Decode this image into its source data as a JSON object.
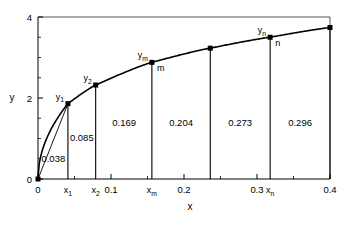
{
  "chart_data": {
    "type": "line",
    "title": "",
    "xlabel": "x",
    "ylabel": "y",
    "xlim": [
      0,
      0.4
    ],
    "ylim": [
      0,
      4
    ],
    "grid": false,
    "legend": "none",
    "x_ticks": [
      "0",
      "0.1",
      "0.2",
      "0.3",
      "0.4"
    ],
    "x_tick_values": [
      0,
      0.1,
      0.2,
      0.3,
      0.4
    ],
    "x_minor_step": 0.05,
    "y_ticks": [
      "0",
      "2",
      "4"
    ],
    "y_tick_values": [
      0,
      2,
      4
    ],
    "y_minor_step": 0.5,
    "series": [
      {
        "name": "curve",
        "x": [
          0,
          0.041,
          0.079,
          0.156,
          0.236,
          0.318,
          0.4
        ],
        "y": [
          0,
          1.86,
          2.32,
          2.88,
          3.23,
          3.5,
          3.74
        ]
      }
    ],
    "points": [
      {
        "label": "y_1",
        "label_text": "y",
        "sub": "1",
        "x": 0.041,
        "y": 1.86,
        "marker_label": ""
      },
      {
        "label": "y_2",
        "label_text": "y",
        "sub": "2",
        "x": 0.079,
        "y": 2.32,
        "marker_label": ""
      },
      {
        "label": "y_m",
        "label_text": "y",
        "sub": "m",
        "x": 0.156,
        "y": 2.88,
        "marker_label": "m"
      },
      {
        "label": "unlabeled",
        "label_text": "",
        "sub": "",
        "x": 0.236,
        "y": 3.23,
        "marker_label": ""
      },
      {
        "label": "y_n",
        "label_text": "y",
        "sub": "n",
        "x": 0.318,
        "y": 3.5,
        "marker_label": "n"
      },
      {
        "label": "end",
        "label_text": "",
        "sub": "",
        "x": 0.4,
        "y": 3.74,
        "marker_label": ""
      }
    ],
    "x_point_labels": [
      {
        "text": "x",
        "sub": "1",
        "x": 0.041
      },
      {
        "text": "x",
        "sub": "2",
        "x": 0.079
      },
      {
        "text": "x",
        "sub": "m",
        "x": 0.156
      },
      {
        "text": "x",
        "sub": "n",
        "x": 0.318
      }
    ],
    "area_labels": [
      {
        "value": "0.038",
        "x_center": 0.021,
        "y_center": 0.42
      },
      {
        "value": "0.085",
        "x_center": 0.06,
        "y_center": 0.95
      },
      {
        "value": "0.169",
        "x_center": 0.118,
        "y_center": 1.3
      },
      {
        "value": "0.204",
        "x_center": 0.196,
        "y_center": 1.3
      },
      {
        "value": "0.273",
        "x_center": 0.277,
        "y_center": 1.3
      },
      {
        "value": "0.296",
        "x_center": 0.359,
        "y_center": 1.3
      }
    ],
    "annotations": [
      {
        "name": "chord-origin-to-y1",
        "type": "line",
        "from": [
          0,
          0
        ],
        "to": [
          0.041,
          1.86
        ]
      }
    ],
    "colors": {
      "line": "#000000",
      "marker": "#000000",
      "axis": "#000000",
      "frame": "#555555",
      "background": "#ffffff"
    }
  }
}
